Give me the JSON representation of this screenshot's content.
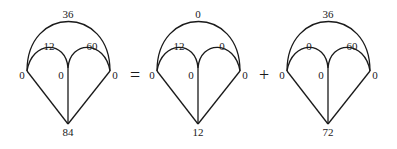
{
  "equation": {
    "operators": [
      "=",
      "+"
    ],
    "diagrams": [
      {
        "name": "lhs",
        "top_arc": "36",
        "left_arc": "12",
        "right_arc": "60",
        "left_node": "0",
        "center_node": "0",
        "right_node": "0",
        "bottom_node": "84"
      },
      {
        "name": "term-1",
        "top_arc": "0",
        "left_arc": "12",
        "right_arc": "0",
        "left_node": "0",
        "center_node": "0",
        "right_node": "0",
        "bottom_node": "12"
      },
      {
        "name": "term-2",
        "top_arc": "36",
        "left_arc": "0",
        "right_arc": "60",
        "left_node": "0",
        "center_node": "0",
        "right_node": "0",
        "bottom_node": "72"
      }
    ]
  }
}
